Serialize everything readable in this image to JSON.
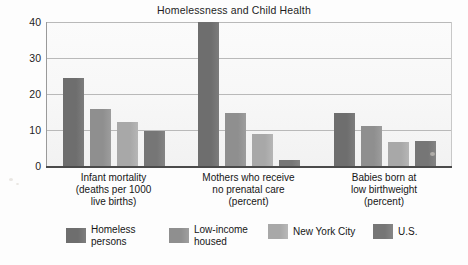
{
  "chart_data": {
    "type": "bar",
    "title": "Homelessness and Child Health",
    "xlabel": "",
    "ylabel": "",
    "ylim": [
      0,
      40
    ],
    "yticks": [
      0,
      10,
      20,
      30,
      40
    ],
    "ytick_labels": [
      "0",
      "10",
      "20",
      "30",
      "40"
    ],
    "grid": true,
    "legend_position": "bottom",
    "categories": [
      "Infant mortality\n(deaths per 1000\nlive births)",
      "Mothers who receive\nno prenatal care\n(percent)",
      "Babies born at\nlow birthweight\n(percent)"
    ],
    "series": [
      {
        "name": "Homeless\npersons",
        "color": "#6e6e6e",
        "values": [
          24.5,
          40.0,
          15.0
        ]
      },
      {
        "name": "Low-income\nhoused",
        "color": "#8f8f8f",
        "values": [
          16.0,
          15.0,
          11.2
        ]
      },
      {
        "name": "New York City",
        "color": "#a8a8a8",
        "values": [
          12.4,
          9.0,
          6.8
        ]
      },
      {
        "name": "U.S.",
        "color": "#767676",
        "values": [
          10.0,
          2.0,
          7.2
        ]
      }
    ]
  },
  "axis": {
    "tick_0": "0",
    "tick_10": "10",
    "tick_20": "20",
    "tick_30": "30",
    "tick_40": "40"
  },
  "groups": [
    {
      "label": "Infant mortality\n(deaths per 1000\nlive births)"
    },
    {
      "label": "Mothers who receive\nno prenatal care\n(percent)"
    },
    {
      "label": "Babies born at\nlow birthweight\n(percent)"
    }
  ],
  "legend": {
    "items": [
      {
        "label": "Homeless\npersons",
        "color": "#6e6e6e"
      },
      {
        "label": "Low-income\nhoused",
        "color": "#8f8f8f"
      },
      {
        "label": "New York City",
        "color": "#a8a8a8"
      },
      {
        "label": "U.S.",
        "color": "#767676"
      }
    ]
  }
}
